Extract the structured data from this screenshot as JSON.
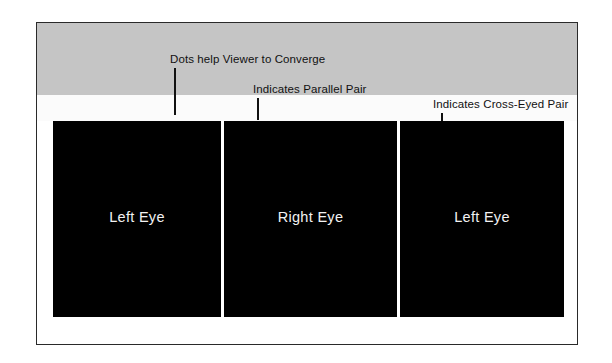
{
  "figure": {
    "background_color": "#ffffff",
    "band_color": "#c5c5c5",
    "panel_color": "#000000",
    "text_color": "#111111",
    "panel_text_color": "#f2f2f2"
  },
  "annotations": [
    {
      "id": "dots-callout",
      "text": "Dots help Viewer to Converge",
      "label_left": 133,
      "label_top": 30,
      "leader_left": 137,
      "leader_top": 45,
      "leader_height": 47
    },
    {
      "id": "parallel-callout",
      "text": "Indicates Parallel Pair",
      "label_left": 216,
      "label_top": 60,
      "leader_left": 220,
      "leader_top": 75,
      "leader_height": 22
    },
    {
      "id": "cross-eyed-callout",
      "text": "Indicates Cross-Eyed Pair",
      "label_left": 396,
      "label_top": 75,
      "leader_left": 404,
      "leader_top": 90,
      "leader_height": 9
    }
  ],
  "markers": [
    {
      "id": "marker-dot-1",
      "type": "dot",
      "name": "convergence-dot",
      "left": 134,
      "top": 105
    },
    {
      "id": "marker-parallel",
      "type": "parallel",
      "name": "parallel-pair-marker",
      "symbol": "||",
      "left": 214,
      "top": 103
    },
    {
      "id": "marker-dot-2",
      "type": "dot",
      "name": "convergence-dot",
      "left": 306,
      "top": 105
    },
    {
      "id": "marker-cross",
      "type": "cross",
      "name": "cross-eyed-pair-marker",
      "symbol": "x",
      "left": 400,
      "top": 103
    },
    {
      "id": "marker-dot-3",
      "type": "dot",
      "name": "convergence-dot",
      "left": 480,
      "top": 105
    }
  ],
  "panels": [
    {
      "id": "panel-left-eye-1",
      "label": "Left Eye",
      "left": 16,
      "width": 168
    },
    {
      "id": "panel-right-eye",
      "label": "Right Eye",
      "left": 187,
      "width": 173
    },
    {
      "id": "panel-left-eye-2",
      "label": "Left Eye",
      "left": 363,
      "width": 164
    }
  ]
}
